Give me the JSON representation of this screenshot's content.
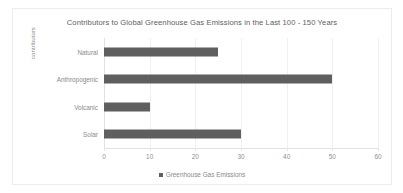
{
  "chart_data": {
    "type": "bar",
    "orientation": "horizontal",
    "title": "Contributors to Global Greenhouse Gas Emissions in the Last 100 - 150 Years",
    "xlabel": "",
    "ylabel": "contributors",
    "categories": [
      "Natural",
      "Anthropogenic",
      "Volcanic",
      "Solar"
    ],
    "values": [
      25,
      50,
      10,
      30
    ],
    "series": [
      {
        "name": "Greenhouse Gas Emissions",
        "values": [
          25,
          50,
          10,
          30
        ],
        "color": "#5f5f5f"
      }
    ],
    "xlim": [
      0,
      60
    ],
    "xticks": [
      "0",
      "10",
      "20",
      "30",
      "40",
      "50",
      "60"
    ],
    "xtick_values": [
      0,
      10,
      20,
      30,
      40,
      50,
      60
    ],
    "grid": true,
    "grid_axis": "x",
    "legend": {
      "position": "bottom",
      "entries": [
        {
          "label": "Greenhouse Gas Emissions",
          "color": "#5f5f5f"
        }
      ]
    }
  },
  "colors": {
    "bar": "#5f5f5f",
    "title_text": "#5d5d5d",
    "axis_text": "#8a8a8a",
    "gridline": "#f0f0f0",
    "axis_line": "#e2e2e2",
    "card_border": "#ececec",
    "background": "#ffffff"
  }
}
